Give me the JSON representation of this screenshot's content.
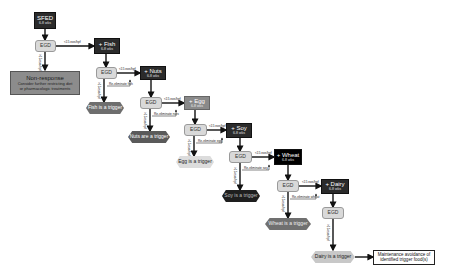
{
  "diagram": {
    "start": {
      "title": "SFED",
      "duration": "6-8 wks"
    },
    "egd_label": "EGD",
    "threshold_low": "<15 eos/hpf",
    "threshold_high": ">15 eos/hpf",
    "non_response": {
      "title": "Non-response",
      "line1": "Consider further restricting diet",
      "line2": "or pharmacologic treatments"
    },
    "steps": [
      {
        "food": "+ Fish",
        "duration": "6-8 wks",
        "reeliminate": "Re-eliminate fish",
        "trigger": "Fish is a trigger"
      },
      {
        "food": "+ Nuts",
        "duration": "6-8 wks",
        "reeliminate": "Re-eliminate nuts",
        "trigger": "Nuts are a trigger"
      },
      {
        "food": "+ Egg",
        "duration": "6-8 wks",
        "reeliminate": "Re-eliminate egg",
        "trigger": "Egg is a trigger"
      },
      {
        "food": "+ Soy",
        "duration": "6-8 wks",
        "reeliminate": "Re-eliminate soy",
        "trigger": "Soy is a trigger"
      },
      {
        "food": "+ Wheat",
        "duration": "6-8 wks",
        "reeliminate": "Re-eliminate wheat",
        "trigger": "Wheat is a trigger"
      },
      {
        "food": "+ Dairy",
        "duration": "6-8 wks",
        "reeliminate": "",
        "trigger": "Dairy is a trigger"
      }
    ],
    "maintenance": "Maintenance avoidance of identified trigger food(s)",
    "colors": {
      "food_box": "#2b2b2b",
      "egg_box": "#8a8a8a",
      "wheat_box": "#000000",
      "egd_box": "#d9d9d9",
      "non_response": "#8c8c8c",
      "trigger_fish": "#6e6e6e",
      "trigger_nuts": "#5a5a5a",
      "trigger_egg": "#dcdcdc",
      "trigger_soy": "#1e1e1e",
      "trigger_wheat": "#707070",
      "trigger_dairy": "#c8c8c8"
    }
  }
}
